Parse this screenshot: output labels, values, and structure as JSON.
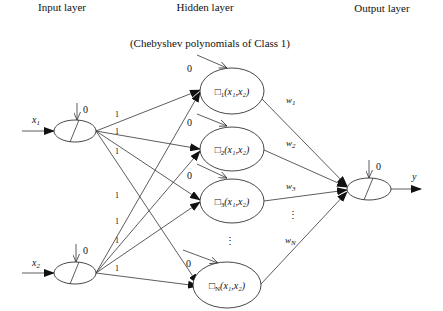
{
  "headers": {
    "input": "Input layer",
    "hidden": "Hidden layer",
    "output": "Output layer",
    "subtitle": "(Chebyshev polynomials of Class 1)"
  },
  "input_nodes": [
    {
      "id": "x1",
      "label": "x",
      "sub": "1",
      "bias": "0",
      "cx": 75,
      "cy": 131
    },
    {
      "id": "x2",
      "label": "x",
      "sub": "2",
      "bias": "0",
      "cx": 75,
      "cy": 273
    }
  ],
  "hidden_nodes": [
    {
      "id": "h1",
      "fn": "□",
      "sub": "1",
      "args": "(x₁,x₂)",
      "bias": "0",
      "cx": 232,
      "cy": 91,
      "weight": "w",
      "wsub": "1"
    },
    {
      "id": "h2",
      "fn": "□",
      "sub": "2",
      "args": "(x₁,x₂)",
      "bias": "0",
      "cx": 232,
      "cy": 149,
      "weight": "w",
      "wsub": "2"
    },
    {
      "id": "h3",
      "fn": "□",
      "sub": "3",
      "args": "(x₁,x₂)",
      "bias": "0",
      "cx": 232,
      "cy": 201,
      "weight": "w",
      "wsub": "3"
    },
    {
      "id": "hN",
      "fn": "□",
      "sub": "N",
      "args": "(x₁,x₂)",
      "bias": "0",
      "cx": 232,
      "cy": 285,
      "weight": "w",
      "wsub": "N"
    }
  ],
  "ellipsis": {
    "hidden": "⋮",
    "weights": "⋮"
  },
  "connection_weight": "1",
  "connection_labels": [
    "1",
    "1",
    "1",
    "1",
    "1",
    "1",
    "1",
    "1"
  ],
  "output_node": {
    "label": "y",
    "bias": "0",
    "cx": 369,
    "cy": 189
  },
  "colors": {
    "stroke": "#333333",
    "text": "#111111",
    "background": "#ffffff"
  }
}
